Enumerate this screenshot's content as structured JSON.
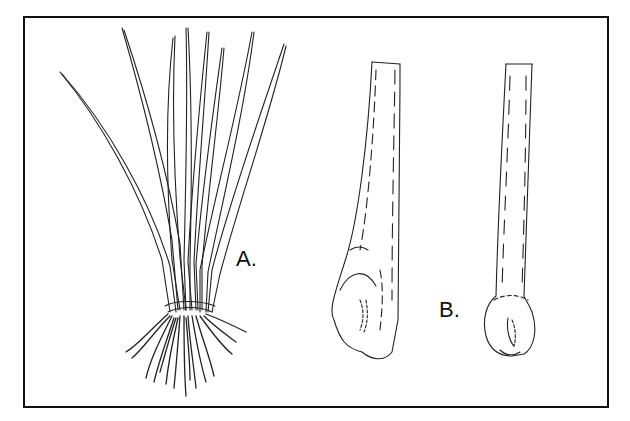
{
  "figure": {
    "type": "botanical line illustration",
    "border_color": "#111111",
    "stroke_color": "#222222",
    "background": "#ffffff",
    "panels": [
      {
        "id": "A",
        "label": "A.",
        "subject": "whole plant with grass-like leaves and fibrous roots"
      },
      {
        "id": "B",
        "label": "B.",
        "subject": "two leaf bases / stem sections with swollen bulbous bases"
      }
    ]
  }
}
